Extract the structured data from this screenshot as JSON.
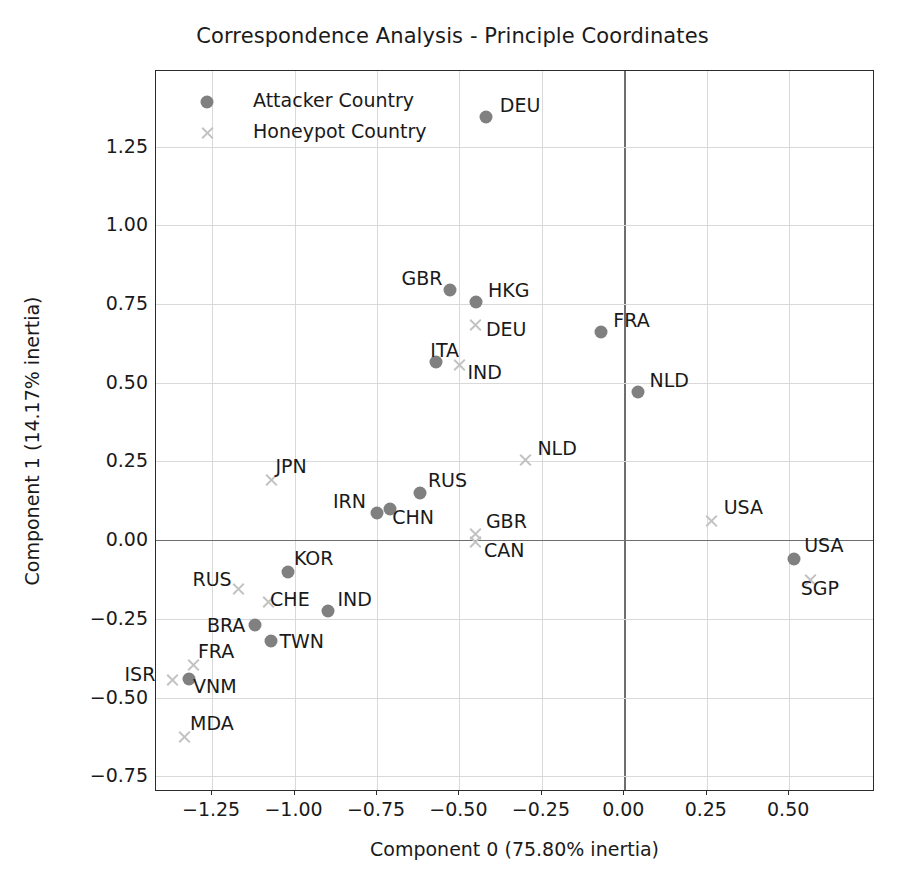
{
  "chart_data": {
    "type": "scatter",
    "title": "Correspondence Analysis - Principle Coordinates",
    "xlabel": "Component 0 (75.80% inertia)",
    "ylabel": "Component 1 (14.17% inertia)",
    "xlim": [
      -1.42,
      0.76
    ],
    "ylim": [
      -0.8,
      1.49
    ],
    "xticks": [
      "−1.25",
      "−1.00",
      "−0.75",
      "−0.50",
      "−0.25",
      "0.00",
      "0.25",
      "0.50"
    ],
    "xtickvals": [
      -1.25,
      -1.0,
      -0.75,
      -0.5,
      -0.25,
      0.0,
      0.25,
      0.5
    ],
    "yticks": [
      "1.25",
      "1.00",
      "0.75",
      "0.50",
      "0.25",
      "0.00",
      "−0.25",
      "−0.50",
      "−0.75"
    ],
    "ytickvals": [
      1.25,
      1.0,
      0.75,
      0.5,
      0.25,
      0.0,
      -0.25,
      -0.5,
      -0.75
    ],
    "grid": true,
    "legend_position": "upper left",
    "colors": {
      "attacker": "#808080",
      "honeypot": "#c2c2c2",
      "axis": "#2b2b2b",
      "grid": "#d9d9d9",
      "zero_line": "#6e6e6e"
    },
    "series": [
      {
        "name": "Attacker Country",
        "marker": "circle",
        "color": "#808080",
        "points": [
          {
            "label": "DEU",
            "x": -0.42,
            "y": 1.345,
            "lx": 14,
            "ly": -14
          },
          {
            "label": "GBR",
            "x": -0.53,
            "y": 0.795,
            "lx": -48,
            "ly": -14
          },
          {
            "label": "HKG",
            "x": -0.45,
            "y": 0.755,
            "lx": 12,
            "ly": -14
          },
          {
            "label": "ITA",
            "x": -0.57,
            "y": 0.565,
            "lx": -6,
            "ly": -14
          },
          {
            "label": "FRA",
            "x": -0.07,
            "y": 0.66,
            "lx": 12,
            "ly": -14
          },
          {
            "label": "NLD",
            "x": 0.04,
            "y": 0.47,
            "lx": 12,
            "ly": -14
          },
          {
            "label": "RUS",
            "x": -0.62,
            "y": 0.15,
            "lx": 8,
            "ly": -15
          },
          {
            "label": "IRN",
            "x": -0.75,
            "y": 0.085,
            "lx": -44,
            "ly": -14
          },
          {
            "label": "CHN",
            "x": -0.71,
            "y": 0.1,
            "lx": 2,
            "ly": 6
          },
          {
            "label": "KOR",
            "x": -1.02,
            "y": -0.1,
            "lx": 6,
            "ly": -16
          },
          {
            "label": "IND",
            "x": -0.9,
            "y": -0.225,
            "lx": 10,
            "ly": -14
          },
          {
            "label": "BRA",
            "x": -1.12,
            "y": -0.27,
            "lx": -48,
            "ly": -2
          },
          {
            "label": "TWN",
            "x": -1.07,
            "y": -0.32,
            "lx": 8,
            "ly": -2
          },
          {
            "label": "VNM",
            "x": -1.32,
            "y": -0.44,
            "lx": 4,
            "ly": 5
          },
          {
            "label": "USA",
            "x": 0.515,
            "y": -0.06,
            "lx": 10,
            "ly": -16
          }
        ]
      },
      {
        "name": "Honeypot Country",
        "marker": "x",
        "color": "#c2c2c2",
        "points": [
          {
            "label": "DEU",
            "x": -0.45,
            "y": 0.685,
            "lx": 10,
            "ly": 2
          },
          {
            "label": "IND",
            "x": -0.5,
            "y": 0.555,
            "lx": 8,
            "ly": 5
          },
          {
            "label": "NLD",
            "x": -0.3,
            "y": 0.255,
            "lx": 12,
            "ly": -14
          },
          {
            "label": "USA",
            "x": 0.265,
            "y": 0.06,
            "lx": 12,
            "ly": -16
          },
          {
            "label": "GBR",
            "x": -0.45,
            "y": 0.02,
            "lx": 10,
            "ly": -15
          },
          {
            "label": "CAN",
            "x": -0.45,
            "y": -0.005,
            "lx": 8,
            "ly": 6
          },
          {
            "label": "SGP",
            "x": 0.565,
            "y": -0.125,
            "lx": -10,
            "ly": 6
          },
          {
            "label": "JPN",
            "x": -1.07,
            "y": 0.19,
            "lx": 4,
            "ly": -16
          },
          {
            "label": "RUS",
            "x": -1.17,
            "y": -0.155,
            "lx": -46,
            "ly": -12
          },
          {
            "label": "CHE",
            "x": -1.08,
            "y": -0.195,
            "lx": 2,
            "ly": -5
          },
          {
            "label": "FRA",
            "x": -1.305,
            "y": -0.395,
            "lx": 4,
            "ly": -16
          },
          {
            "label": "ISR",
            "x": -1.37,
            "y": -0.445,
            "lx": -48,
            "ly": -8
          },
          {
            "label": "MDA",
            "x": -1.335,
            "y": -0.625,
            "lx": 6,
            "ly": -16
          }
        ]
      }
    ]
  },
  "legend": {
    "items": [
      {
        "label": "Attacker Country",
        "marker": "circle"
      },
      {
        "label": "Honeypot Country",
        "marker": "x"
      }
    ]
  }
}
